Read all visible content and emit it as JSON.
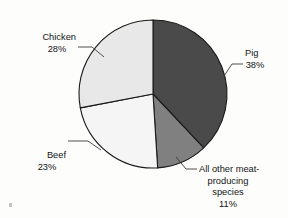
{
  "figure": {
    "background_color": "#fdfdfc",
    "outline_color": "#1a1a1a",
    "leader_color": "#3a3a3a",
    "text_color": "#141414"
  },
  "artifact": {
    "name": "scan-speck",
    "description": "small scanner speck in lower-left corner"
  },
  "chart_data": {
    "type": "pie",
    "title": "",
    "subtitle": "",
    "xlabel": "",
    "ylabel": "",
    "grid": false,
    "legend_position": "none",
    "label_style": "external-with-leader-lines",
    "units": "percent",
    "total": 100,
    "start_angle_deg": 0,
    "direction": "clockwise",
    "center": {
      "x": 153,
      "y": 94
    },
    "radius": 74,
    "categories": [
      "Pig",
      "All other meat-producing species",
      "Beef",
      "Chicken"
    ],
    "values": [
      38,
      11,
      23,
      28
    ],
    "slices": [
      {
        "name": "Pig",
        "value": 38,
        "value_label": "38%",
        "label_lines": [
          "Pig",
          "38%"
        ],
        "color": "#4a4a4a",
        "start_angle_deg": 0,
        "end_angle_deg": 136.8,
        "label_anchor": "start",
        "label_x": 245,
        "label_y": 56,
        "leader": {
          "tip_x": 224,
          "tip_y": 76,
          "elbow_x": 232,
          "elbow_y": 64,
          "end_x": 243,
          "end_y": 64
        }
      },
      {
        "name": "All other meat-producing species",
        "value": 11,
        "value_label": "11%",
        "label_lines": [
          "All other meat-",
          "producing",
          "species",
          "11%"
        ],
        "color": "#808080",
        "start_angle_deg": 136.8,
        "end_angle_deg": 176.4,
        "label_anchor": "start",
        "label_x": 199,
        "label_y": 172,
        "leader": {
          "tip_x": 176,
          "tip_y": 157,
          "elbow_x": 186,
          "elbow_y": 169,
          "end_x": 197,
          "end_y": 169
        }
      },
      {
        "name": "Beef",
        "value": 23,
        "value_label": "23%",
        "label_lines": [
          "Beef",
          "23%"
        ],
        "color": "#f5f5f5",
        "start_angle_deg": 176.4,
        "end_angle_deg": 259.2,
        "label_anchor": "end",
        "label_x": 66,
        "label_y": 158,
        "leader": {
          "tip_x": 101,
          "tip_y": 150,
          "elbow_x": 88,
          "elbow_y": 141,
          "end_x": 68,
          "end_y": 141
        }
      },
      {
        "name": "Chicken",
        "value": 28,
        "value_label": "28%",
        "label_lines": [
          "Chicken",
          "28%"
        ],
        "color": "#e8e8e8",
        "start_angle_deg": 259.2,
        "end_angle_deg": 360,
        "label_anchor": "end",
        "label_x": 76,
        "label_y": 40,
        "leader": {
          "tip_x": 104,
          "tip_y": 57,
          "elbow_x": 92,
          "elbow_y": 47,
          "end_x": 78,
          "end_y": 47
        }
      }
    ]
  }
}
